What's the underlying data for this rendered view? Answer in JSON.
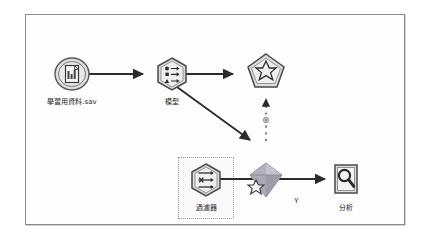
{
  "canvas": {
    "background_color": "#fdfdfd",
    "border_color": "#8a8a8a"
  },
  "colors": {
    "node_fill": "#d8d8d8",
    "node_fill_light": "#ededed",
    "node_stroke": "#4a4a4a",
    "link_color": "#2b2b2b",
    "nugget_fill": "#b9b9c6",
    "selection_border": "#9a9a9a"
  },
  "nodes": [
    {
      "id": "source",
      "label": "學習用資料.sav",
      "icon": "statistics-file-icon",
      "shape": "circle",
      "x": 46,
      "y": 52
    },
    {
      "id": "model",
      "label": "模型",
      "icon": "model-build-icon",
      "shape": "hexagon",
      "x": 146,
      "y": 52
    },
    {
      "id": "nugget",
      "label": "",
      "icon": "model-nugget-icon",
      "shape": "pentagon",
      "x": 240,
      "y": 48
    },
    {
      "id": "filter",
      "label": "過濾器",
      "icon": "filter-icon",
      "shape": "hexagon",
      "x": 148,
      "y": 146,
      "selected": true
    },
    {
      "id": "applier",
      "label": "",
      "icon": "generated-model-diamond-icon",
      "shape": "diamond",
      "x": 240,
      "y": 146
    },
    {
      "id": "analysis",
      "label": "分析",
      "icon": "magnifier-icon",
      "shape": "square",
      "x": 318,
      "y": 146
    }
  ],
  "annotations": {
    "applier_field_label": "Y"
  },
  "links": [
    {
      "from": "source",
      "to": "model",
      "style": "solid",
      "arrow": true
    },
    {
      "from": "model",
      "to": "nugget",
      "style": "solid",
      "arrow": true
    },
    {
      "from": "model",
      "to": "applier",
      "style": "solid",
      "arrow": true
    },
    {
      "from": "applier",
      "to": "nugget",
      "style": "dashed",
      "arrow": true
    },
    {
      "from": "applier",
      "to": "filter",
      "style": "solid",
      "arrow": true
    },
    {
      "from": "applier",
      "to": "analysis",
      "style": "solid",
      "arrow": true
    }
  ]
}
